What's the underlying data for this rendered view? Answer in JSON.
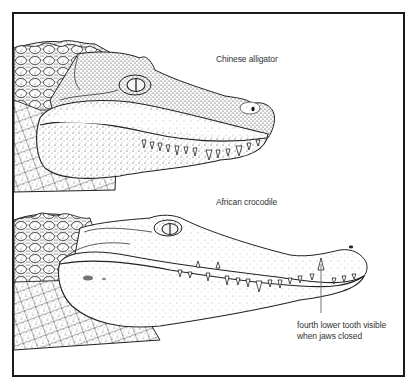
{
  "figure": {
    "frame_color": "#1a1a1a",
    "ink_color": "#222222"
  },
  "labels": {
    "alligator": "Chinese alligator",
    "crocodile": "African crocodile",
    "tooth_note_line1": "fourth lower tooth visible",
    "tooth_note_line2": "when jaws closed"
  },
  "illustrations": [
    {
      "name": "chinese-alligator-head",
      "position": "top",
      "snout": "broad, rounded"
    },
    {
      "name": "african-crocodile-head",
      "position": "bottom",
      "snout": "long, narrow"
    }
  ],
  "annotation": {
    "leader_line": {
      "x": 321,
      "y_from": 264,
      "y_to": 313,
      "color": "#777777"
    }
  }
}
